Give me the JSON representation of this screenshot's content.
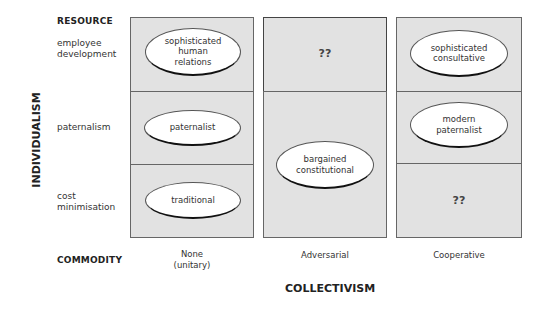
{
  "axes": {
    "y_axis_label": "INDIVIDUALISM",
    "x_axis_label": "COLLECTIVISM",
    "y_top_label": "RESOURCE",
    "y_bottom_label": "COMMODITY"
  },
  "rows": [
    {
      "label_line1": "employee",
      "label_line2": "development"
    },
    {
      "label_line1": "paternalism",
      "label_line2": ""
    },
    {
      "label_line1": "cost",
      "label_line2": "minimisation"
    }
  ],
  "columns": [
    {
      "label_line1": "None",
      "label_line2": "(unitary)"
    },
    {
      "label_line1": "Adversarial",
      "label_line2": ""
    },
    {
      "label_line1": "Cooperative",
      "label_line2": ""
    }
  ],
  "cells": {
    "c1r1": {
      "line1": "sophisticated",
      "line2": "human",
      "line3": "relations"
    },
    "c1r2": {
      "line1": "paternalist"
    },
    "c1r3": {
      "line1": "traditional"
    },
    "c2r1": {
      "text": "??"
    },
    "c2r23": {
      "line1": "bargained",
      "line2": "constitutional"
    },
    "c3r1": {
      "line1": "sophisticated",
      "line2": "consultative"
    },
    "c3r2": {
      "line1": "modern",
      "line2": "paternalist"
    },
    "c3r3": {
      "text": "??"
    }
  },
  "colors": {
    "cell_fill": "#e2e2e2",
    "cell_border": "#666666",
    "ellipse_fill": "#ffffff",
    "ellipse_shadow": "#111111"
  }
}
